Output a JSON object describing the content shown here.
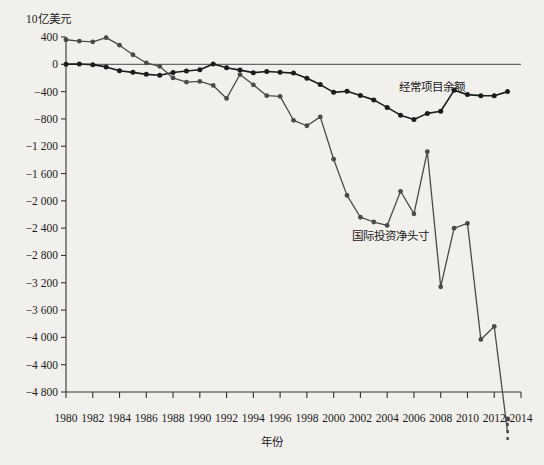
{
  "chart_data": {
    "type": "line",
    "title": "",
    "subtitle": "",
    "unit_label": "10亿美元",
    "xlabel": "年份",
    "ylabel": "",
    "grid": false,
    "legend_position": "inline-annotation",
    "xlim": [
      1980,
      2014
    ],
    "ylim": [
      -5000,
      500
    ],
    "yticks": [
      400,
      0,
      -400,
      -800,
      -1200,
      -1600,
      -2000,
      -2400,
      -2800,
      -3200,
      -3600,
      -4000,
      -4400,
      -4800
    ],
    "ytick_labels": [
      "400",
      "0",
      "−400",
      "−800",
      "−1 200",
      "−1 600",
      "−2 000",
      "−2 400",
      "−2 800",
      "−3 200",
      "−3 600",
      "−4 000",
      "−4 400",
      "−4 800"
    ],
    "xticks": [
      1980,
      1982,
      1984,
      1986,
      1988,
      1990,
      1992,
      1994,
      1996,
      1998,
      2000,
      2002,
      2004,
      2006,
      2008,
      2010,
      2012,
      2014
    ],
    "xtick_labels": [
      "1980",
      "1982",
      "1984",
      "1986",
      "1988",
      "1990",
      "1992",
      "1994",
      "1996",
      "1998",
      "2000",
      "2002",
      "2004",
      "2006",
      "2008",
      "2010",
      "2012",
      "2014"
    ],
    "x": [
      1980,
      1981,
      1982,
      1983,
      1984,
      1985,
      1986,
      1987,
      1988,
      1989,
      1990,
      1991,
      1992,
      1993,
      1994,
      1995,
      1996,
      1997,
      1998,
      1999,
      2000,
      2001,
      2002,
      2003,
      2004,
      2005,
      2006,
      2007,
      2008,
      2009,
      2010,
      2011,
      2012,
      2013
    ],
    "series": [
      {
        "name": "经常项目余额",
        "color": "#1c1c1c",
        "marker": "circle",
        "values": [
          2,
          5,
          -5,
          -38,
          -94,
          -118,
          -147,
          -161,
          -121,
          -99,
          -79,
          3,
          -50,
          -85,
          -122,
          -106,
          -117,
          -129,
          -204,
          -297,
          -411,
          -395,
          -458,
          -521,
          -631,
          -745,
          -807,
          -719,
          -687,
          -381,
          -444,
          -459,
          -461,
          -400
        ]
      },
      {
        "name": "国际投资净头寸",
        "color": "#4a4a4a",
        "marker": "circle",
        "values": [
          360,
          340,
          330,
          390,
          280,
          140,
          20,
          -30,
          -200,
          -260,
          -250,
          -310,
          -500,
          -150,
          -300,
          -460,
          -470,
          -820,
          -900,
          -770,
          -1390,
          -1920,
          -2240,
          -2310,
          -2360,
          -1860,
          -2190,
          -1280,
          -3260,
          -2400,
          -2330,
          -4030,
          -3840,
          -5400
        ]
      }
    ],
    "annotations": [
      {
        "text": "经常项目余额",
        "x": 399,
        "y": 78
      },
      {
        "text": "国际投资净头寸",
        "x": 352,
        "y": 227
      }
    ],
    "dashed_extension": {
      "series": "国际投资净头寸",
      "note": "line continues below axis at 2013 with dashed segment"
    }
  }
}
